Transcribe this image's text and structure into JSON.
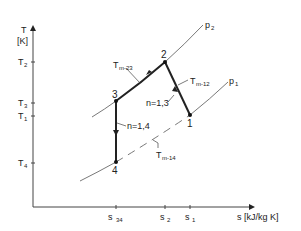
{
  "diagram": {
    "type": "T-s diagram",
    "y_axis": {
      "label": "T",
      "unit": "[K]"
    },
    "x_axis": {
      "label": "s [kJ/kg K]"
    },
    "y_ticks": [
      {
        "name": "T",
        "sub": "2"
      },
      {
        "name": "T",
        "sub": "3"
      },
      {
        "name": "T",
        "sub": "1"
      },
      {
        "name": "T",
        "sub": "4"
      }
    ],
    "x_ticks": [
      {
        "name": "s",
        "sub": "34"
      },
      {
        "name": "s",
        "sub": "2"
      },
      {
        "name": "s",
        "sub": "1"
      }
    ],
    "isobars": [
      {
        "name": "p",
        "sub": "2"
      },
      {
        "name": "p",
        "sub": "1"
      }
    ],
    "points": [
      "1",
      "2",
      "3",
      "4"
    ],
    "annotations": {
      "tm23": {
        "name": "T",
        "sub": "m-23"
      },
      "tm12": {
        "name": "T",
        "sub": "m-12"
      },
      "tm14": {
        "name": "T",
        "sub": "m-14"
      },
      "n13": "n=1,3",
      "n14": "n=1,4"
    },
    "colors": {
      "line": "#222222",
      "isobar": "#555555",
      "text": "#222222"
    }
  }
}
